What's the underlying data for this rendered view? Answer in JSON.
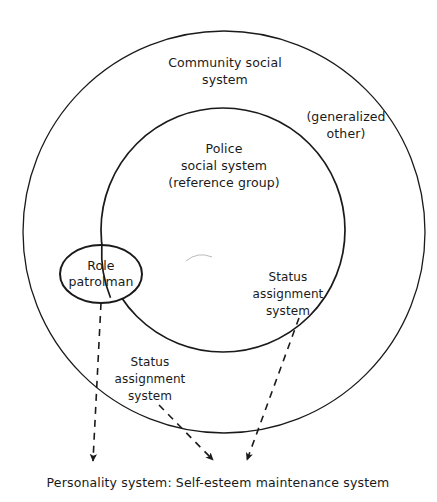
{
  "diagram": {
    "type": "venn-nested-circles",
    "background_color": "#ffffff",
    "stroke_color": "#1a1a1a",
    "labels": {
      "community_social_system": "Community social\nsystem",
      "generalized_other": "(generalized\nother)",
      "police_social_system": "Police\nsocial system\n(reference group)",
      "role_patrolman": "Role\npatrolman",
      "status_assignment_system_right": "Status\nassignment\nsystem",
      "status_assignment_system_left": "Status\nassignment\nsystem",
      "personality_system": "Personality system: Self-esteem maintenance system"
    },
    "shapes": [
      {
        "name": "community-social-system-circle",
        "shape": "circle",
        "cx": 224,
        "cy": 232,
        "r": 201,
        "stroke_width": 1.3
      },
      {
        "name": "police-social-system-circle",
        "shape": "circle",
        "cx": 223,
        "cy": 230,
        "r": 122,
        "stroke_width": 1.6
      },
      {
        "name": "role-patrolman-ellipse",
        "shape": "ellipse",
        "cx": 101,
        "cy": 274,
        "rx": 41,
        "ry": 29,
        "stroke_width": 1.9
      }
    ],
    "connectors": [
      {
        "name": "role-patrolman-to-personality-arrow",
        "style": "dashed",
        "from": [
          101,
          303
        ],
        "to": [
          93,
          462
        ]
      },
      {
        "name": "status-assignment-left-to-personality-arrow",
        "style": "dashed",
        "from": [
          160,
          408
        ],
        "to": [
          214,
          462
        ]
      },
      {
        "name": "status-assignment-right-to-personality-arrow",
        "style": "dashed",
        "from": [
          298,
          320
        ],
        "to": [
          247,
          462
        ]
      }
    ]
  }
}
